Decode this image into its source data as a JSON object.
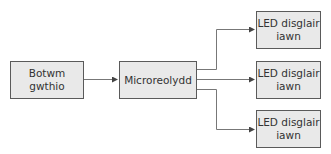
{
  "diagram": {
    "type": "block-diagram",
    "colors": {
      "box_fill": "#e9e9e9",
      "box_border": "#5a5a5a",
      "line": "#777777",
      "text": "#333333"
    },
    "nodes": {
      "input": {
        "label": "Botwm gwthio"
      },
      "controller": {
        "label": "Microreolydd"
      },
      "outputs": [
        {
          "label": "LED disglair iawn"
        },
        {
          "label": "LED disglair iawn"
        },
        {
          "label": "LED disglair iawn"
        }
      ]
    },
    "edges": [
      {
        "from": "Botwm gwthio",
        "to": "Microreolydd"
      },
      {
        "from": "Microreolydd",
        "to": "LED disglair iawn (1)"
      },
      {
        "from": "Microreolydd",
        "to": "LED disglair iawn (2)"
      },
      {
        "from": "Microreolydd",
        "to": "LED disglair iawn (3)"
      }
    ]
  }
}
